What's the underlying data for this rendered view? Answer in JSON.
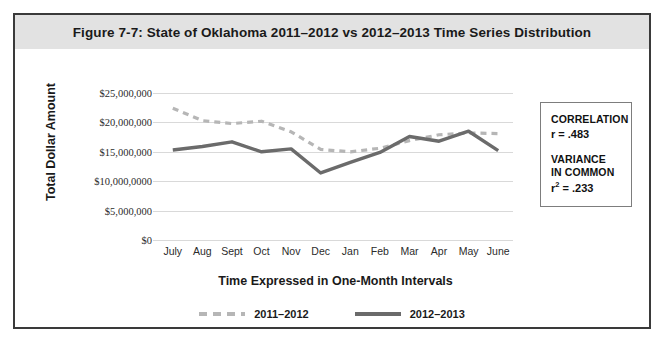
{
  "figure": {
    "title": "Figure 7-7: State of Oklahoma 2011–2012 vs 2012–2013 Time Series Distribution"
  },
  "stats": {
    "correlation_heading": "CORRELATION",
    "correlation_value": "r = .483",
    "variance_heading_line1": "VARIANCE",
    "variance_heading_line2": "IN COMMON",
    "variance_value_prefix": "r",
    "variance_value_sup": "2",
    "variance_value_rest": " = .233"
  },
  "colors": {
    "series_2011_2012": "#b6b6b6",
    "series_2012_2013": "#6b6b6b",
    "gridline": "#d9d9d9",
    "frame": "#3a3a3a",
    "banner": "#e2e2e2"
  },
  "chart_data": {
    "type": "line",
    "title": "Figure 7-7: State of Oklahoma 2011–2012 vs 2012–2013 Time Series Distribution",
    "xlabel": "Time Expressed in One-Month Intervals",
    "ylabel": "Total Dollar Amount",
    "categories": [
      "July",
      "Aug",
      "Sept",
      "Oct",
      "Nov",
      "Dec",
      "Jan",
      "Feb",
      "Mar",
      "Apr",
      "May",
      "June"
    ],
    "ylim": [
      0,
      25000000
    ],
    "ytick_values": [
      25000000,
      20000000,
      15000000,
      10000000,
      5000000,
      0
    ],
    "ytick_labels": [
      "$25,000,000",
      "$20,000,000",
      "$15,000,000",
      "$10,000,0000",
      "$5,000,000",
      "$0"
    ],
    "grid": true,
    "legend_position": "bottom",
    "series": [
      {
        "name": "2011–2012",
        "style": "dashed",
        "color": "#b6b6b6",
        "values": [
          22400000,
          20300000,
          19800000,
          20200000,
          18400000,
          15400000,
          15000000,
          15600000,
          16900000,
          17900000,
          18200000,
          18100000
        ]
      },
      {
        "name": "2012–2013",
        "style": "solid",
        "color": "#6b6b6b",
        "values": [
          15300000,
          15900000,
          16700000,
          15000000,
          15500000,
          11400000,
          13200000,
          14900000,
          17600000,
          16800000,
          18500000,
          15200000
        ]
      }
    ]
  }
}
